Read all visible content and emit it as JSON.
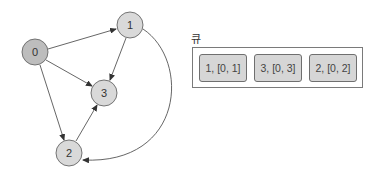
{
  "graph": {
    "nodes": [
      {
        "id": "0",
        "label": "0",
        "x": 35,
        "y": 52,
        "fill": "#bdbdbd"
      },
      {
        "id": "1",
        "label": "1",
        "x": 130,
        "y": 25,
        "fill": "#d9d9d9"
      },
      {
        "id": "3",
        "label": "3",
        "x": 104,
        "y": 93,
        "fill": "#d9d9d9"
      },
      {
        "id": "2",
        "label": "2",
        "x": 69,
        "y": 153,
        "fill": "#d9d9d9"
      }
    ],
    "edges": [
      {
        "from": "0",
        "to": "1"
      },
      {
        "from": "0",
        "to": "3"
      },
      {
        "from": "0",
        "to": "2"
      },
      {
        "from": "1",
        "to": "3"
      },
      {
        "from": "2",
        "to": "3"
      },
      {
        "from": "1",
        "to": "2",
        "curved": true
      }
    ]
  },
  "queue": {
    "label": "큐",
    "items": [
      {
        "label": "1, [0, 1]"
      },
      {
        "label": "3, [0, 3]"
      },
      {
        "label": "2, [0, 2]"
      }
    ]
  }
}
